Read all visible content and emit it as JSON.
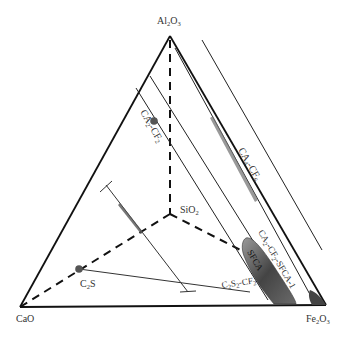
{
  "diagram": {
    "type": "tetrahedral phase diagram",
    "vertices": {
      "top": {
        "label": "Al",
        "sub1": "2",
        "mid": "O",
        "sub2": "3",
        "x": 170,
        "y": 36
      },
      "left": {
        "label": "CaO",
        "x": 20,
        "y": 307
      },
      "right": {
        "label": "Fe",
        "sub1": "2",
        "mid": "O",
        "sub2": "3",
        "x": 325,
        "y": 305
      },
      "inner": {
        "label": "SiO",
        "sub1": "2",
        "x": 170,
        "y": 215
      }
    },
    "labels": {
      "ca2_cf2": {
        "a": "CA",
        "as": "2",
        "b": "-CF",
        "bs": "2"
      },
      "ca4_cf6": {
        "a": "CA",
        "as": "4",
        "b": "-CF",
        "bs": "6"
      },
      "sfca1": {
        "a": "CA",
        "as": "2",
        "b": "-CF",
        "bs": "2",
        "c": "-SFCA-1"
      },
      "sfca": {
        "text": "SFCA"
      },
      "c2s2_cf2": {
        "a": "C",
        "as": "2",
        "b": "S",
        "bs": "2",
        "c": "-CF",
        "cs": "2"
      },
      "c2s": {
        "a": "C",
        "as": "2",
        "b": "S"
      }
    },
    "points": [
      {
        "name": "CA2-CF2 point",
        "x": 154,
        "y": 121
      },
      {
        "name": "C2S point",
        "x": 79,
        "y": 269
      }
    ],
    "colors": {
      "line": "#111111",
      "shade_dark": "#555555",
      "shade_light": "#888888",
      "point": "#555555"
    }
  }
}
